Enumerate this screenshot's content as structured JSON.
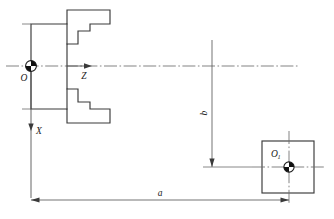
{
  "figure": {
    "line_color": "#3a3a3a",
    "centerline_color": "#6e6e6e",
    "dimension_color": "#5a5a5a",
    "background": "#ffffff"
  },
  "labels": {
    "origin": "O",
    "z_axis": "Z",
    "x_axis": "X",
    "origin_secondary": "O",
    "origin_secondary_sub": "1",
    "dim_horizontal": "a",
    "dim_vertical": "b"
  },
  "geometry": {
    "main_centerline_y": 66,
    "origin_x": 31,
    "origin_y": 66,
    "secondary_origin_x": 289,
    "secondary_origin_y": 167,
    "square_left": 262,
    "square_top": 141,
    "square_size": 52,
    "dim_a_left": 31,
    "dim_a_right": 289,
    "dim_a_y": 200,
    "dim_b_x": 212,
    "dim_b_top": 40,
    "dim_b_bottom": 167
  },
  "elements": [
    {
      "name": "stepped-bracket-profile",
      "type": "outline"
    },
    {
      "name": "square-part-profile",
      "type": "outline"
    },
    {
      "name": "origin-marker-o",
      "type": "marker"
    },
    {
      "name": "origin-marker-o1",
      "type": "marker"
    },
    {
      "name": "z-axis-arrow",
      "type": "axis"
    },
    {
      "name": "x-axis-arrow",
      "type": "axis"
    },
    {
      "name": "dimension-a",
      "type": "dimension"
    },
    {
      "name": "dimension-b",
      "type": "dimension"
    }
  ]
}
